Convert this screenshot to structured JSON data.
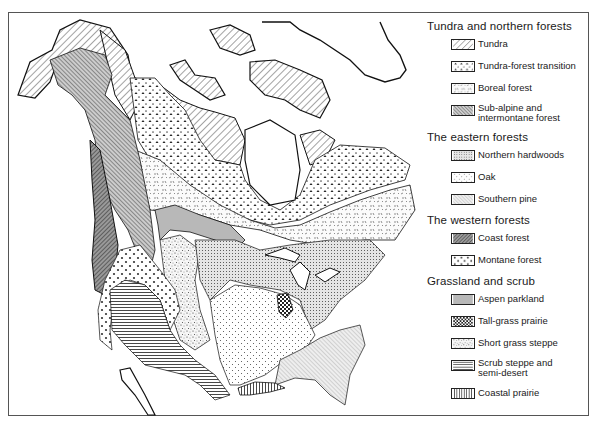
{
  "map": {
    "type": "vegetation map of North America",
    "regions": [
      "Alaska",
      "Canadian Arctic Archipelago",
      "Greenland",
      "Hudson Bay",
      "Great Lakes",
      "Contiguous United States",
      "Mexico (northern)",
      "Gulf of Mexico coast"
    ]
  },
  "legend": {
    "groups": [
      {
        "title": "Tundra and northern forests",
        "items": [
          {
            "label": "Tundra",
            "pattern": "diagonal-hatch"
          },
          {
            "label": "Tundra-forest transition",
            "pattern": "triangles"
          },
          {
            "label": "Boreal forest",
            "pattern": "dashes"
          },
          {
            "label": "Sub-alpine and\nintermontane forest",
            "pattern": "dense-diagonal"
          }
        ]
      },
      {
        "title": "The eastern forests",
        "items": [
          {
            "label": "Northern hardwoods",
            "pattern": "fine-dots"
          },
          {
            "label": "Oak",
            "pattern": "sparse-dots"
          },
          {
            "label": "Southern pine",
            "pattern": "light-diagonal"
          }
        ]
      },
      {
        "title": "The western forests",
        "items": [
          {
            "label": "Coast forest",
            "pattern": "dark-crosshatch"
          },
          {
            "label": "Montane forest",
            "pattern": "circles"
          }
        ]
      },
      {
        "title": "Grassland and scrub",
        "items": [
          {
            "label": "Aspen parkland",
            "pattern": "solid-gray"
          },
          {
            "label": "Tall-grass prairie",
            "pattern": "checker"
          },
          {
            "label": "Short grass steppe",
            "pattern": "speckle"
          },
          {
            "label": "Scrub steppe and\nsemi-desert",
            "pattern": "horizontal-lines"
          },
          {
            "label": "Coastal prairie",
            "pattern": "vertical-lines"
          }
        ]
      }
    ]
  }
}
